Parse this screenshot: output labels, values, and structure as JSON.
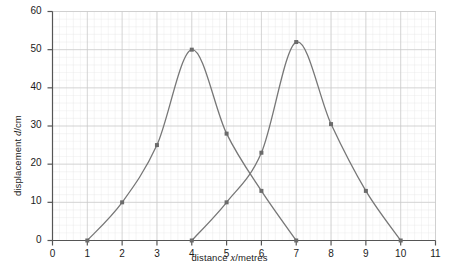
{
  "chart_data": {
    "type": "line",
    "title": "",
    "xlabel": "distance x/metres",
    "xlabel_parts": {
      "pre": "distance ",
      "italic": "x",
      "post": "/metres"
    },
    "ylabel": "displacement d/cm",
    "ylabel_parts": {
      "pre": "displacement ",
      "italic": "d",
      "post": "/cm"
    },
    "xlim": [
      0,
      11
    ],
    "ylim": [
      0,
      60
    ],
    "xticks": [
      0,
      1,
      2,
      3,
      4,
      5,
      6,
      7,
      8,
      9,
      10,
      11
    ],
    "yticks": [
      0,
      10,
      20,
      30,
      40,
      50,
      60
    ],
    "grid": true,
    "grid_minor": true,
    "legend": "none",
    "series": [
      {
        "name": "pulse-1",
        "color": "#777777",
        "marker": "square",
        "x": [
          1,
          2,
          3,
          4,
          5,
          6,
          7
        ],
        "values": [
          0,
          10,
          25,
          50,
          28,
          13,
          0
        ]
      },
      {
        "name": "pulse-2",
        "color": "#777777",
        "marker": "square",
        "x": [
          4,
          5,
          6,
          7,
          8,
          9,
          10
        ],
        "values": [
          0,
          10,
          23,
          52,
          30.5,
          13,
          0
        ]
      }
    ]
  },
  "style": {
    "axis_color": "#555555",
    "grid_major_color": "#c8c8c8",
    "grid_minor_color": "#e6e6e6",
    "curve_color": "#808080",
    "marker_color": "#6b6b6b",
    "background": "#ffffff"
  }
}
